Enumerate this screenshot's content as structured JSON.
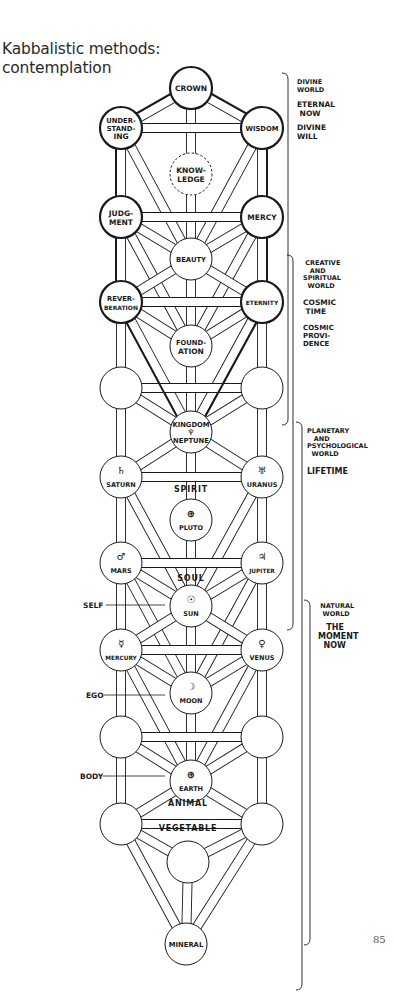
{
  "page": {
    "title_line1": "Kabbalistic methods:",
    "title_line2": "contemplation",
    "page_number": "85"
  },
  "colors": {
    "ink": "#1a1a1a",
    "paper": "#ffffff"
  },
  "nodes": [
    {
      "id": "crown",
      "x": 191,
      "y": 88,
      "lines": [
        "CROWN"
      ],
      "heavy": true
    },
    {
      "id": "understanding",
      "x": 121,
      "y": 128,
      "lines": [
        "UNDER-",
        "STAND-",
        "ING"
      ],
      "heavy": true
    },
    {
      "id": "wisdom",
      "x": 262,
      "y": 128,
      "lines": [
        "WISDOM"
      ],
      "heavy": true
    },
    {
      "id": "knowledge",
      "x": 191,
      "y": 174,
      "lines": [
        "KNOW-",
        "LEDGE"
      ],
      "dashed": true
    },
    {
      "id": "judgment",
      "x": 121,
      "y": 217,
      "lines": [
        "JUDG-",
        "MENT"
      ],
      "heavy": true
    },
    {
      "id": "mercy",
      "x": 262,
      "y": 217,
      "lines": [
        "MERCY"
      ],
      "heavy": true
    },
    {
      "id": "beauty",
      "x": 191,
      "y": 259,
      "lines": [
        "BEAUTY"
      ]
    },
    {
      "id": "reverberation",
      "x": 121,
      "y": 302,
      "lines": [
        "REVER-",
        "BERATION"
      ],
      "heavy": true
    },
    {
      "id": "eternity",
      "x": 262,
      "y": 302,
      "lines": [
        "ETERNITY"
      ],
      "heavy": true
    },
    {
      "id": "foundation",
      "x": 191,
      "y": 346,
      "lines": [
        "FOUND-",
        "ATION"
      ]
    },
    {
      "id": "empty-left-1",
      "x": 121,
      "y": 388,
      "lines": []
    },
    {
      "id": "empty-right-1",
      "x": 262,
      "y": 388,
      "lines": []
    },
    {
      "id": "kingdom",
      "x": 191,
      "y": 432,
      "lines": [
        "KINGDOM",
        "♆",
        "NEPTUNE"
      ]
    },
    {
      "id": "saturn",
      "x": 121,
      "y": 477,
      "symbol": "♄",
      "lines": [
        "SATURN"
      ]
    },
    {
      "id": "uranus",
      "x": 262,
      "y": 477,
      "symbol": "♅",
      "lines": [
        "URANUS"
      ]
    },
    {
      "id": "pluto",
      "x": 191,
      "y": 520,
      "symbol": "⊕",
      "lines": [
        "PLUTO"
      ]
    },
    {
      "id": "mars",
      "x": 121,
      "y": 563,
      "symbol": "♂",
      "lines": [
        "MARS"
      ]
    },
    {
      "id": "jupiter",
      "x": 262,
      "y": 563,
      "symbol": "♃",
      "lines": [
        "JUPITER"
      ]
    },
    {
      "id": "sun",
      "x": 191,
      "y": 606,
      "symbol": "☉",
      "lines": [
        "SUN"
      ]
    },
    {
      "id": "mercury",
      "x": 121,
      "y": 650,
      "symbol": "☿",
      "lines": [
        "MERCURY"
      ]
    },
    {
      "id": "venus",
      "x": 262,
      "y": 650,
      "symbol": "♀",
      "lines": [
        "VENUS"
      ]
    },
    {
      "id": "moon",
      "x": 191,
      "y": 693,
      "symbol": "☽",
      "lines": [
        "MOON"
      ]
    },
    {
      "id": "empty-left-2",
      "x": 121,
      "y": 737,
      "lines": []
    },
    {
      "id": "empty-right-2",
      "x": 262,
      "y": 737,
      "lines": []
    },
    {
      "id": "earth",
      "x": 191,
      "y": 781,
      "symbol": "⊕",
      "lines": [
        "EARTH"
      ]
    },
    {
      "id": "empty-left-3",
      "x": 121,
      "y": 824,
      "lines": []
    },
    {
      "id": "empty-right-3",
      "x": 262,
      "y": 824,
      "lines": []
    },
    {
      "id": "vegetable-node",
      "x": 188,
      "y": 862,
      "lines": []
    },
    {
      "id": "mineral",
      "x": 186,
      "y": 944,
      "lines": [
        "MINERAL"
      ]
    }
  ],
  "paths": [
    [
      "crown",
      "understanding"
    ],
    [
      "crown",
      "wisdom"
    ],
    [
      "crown",
      "knowledge"
    ],
    [
      "understanding",
      "wisdom"
    ],
    [
      "understanding",
      "judgment"
    ],
    [
      "understanding",
      "beauty"
    ],
    [
      "wisdom",
      "mercy"
    ],
    [
      "wisdom",
      "beauty"
    ],
    [
      "knowledge",
      "beauty"
    ],
    [
      "judgment",
      "mercy"
    ],
    [
      "judgment",
      "beauty"
    ],
    [
      "judgment",
      "reverberation"
    ],
    [
      "judgment",
      "foundation"
    ],
    [
      "mercy",
      "beauty"
    ],
    [
      "mercy",
      "eternity"
    ],
    [
      "mercy",
      "foundation"
    ],
    [
      "beauty",
      "reverberation"
    ],
    [
      "beauty",
      "eternity"
    ],
    [
      "beauty",
      "foundation"
    ],
    [
      "reverberation",
      "eternity"
    ],
    [
      "reverberation",
      "foundation"
    ],
    [
      "reverberation",
      "empty-left-1"
    ],
    [
      "reverberation",
      "kingdom"
    ],
    [
      "eternity",
      "foundation"
    ],
    [
      "eternity",
      "empty-right-1"
    ],
    [
      "eternity",
      "kingdom"
    ],
    [
      "foundation",
      "kingdom"
    ],
    [
      "empty-left-1",
      "empty-right-1"
    ],
    [
      "empty-left-1",
      "kingdom"
    ],
    [
      "empty-left-1",
      "saturn"
    ],
    [
      "empty-right-1",
      "kingdom"
    ],
    [
      "empty-right-1",
      "uranus"
    ],
    [
      "kingdom",
      "saturn"
    ],
    [
      "kingdom",
      "uranus"
    ],
    [
      "kingdom",
      "pluto"
    ],
    [
      "saturn",
      "uranus"
    ],
    [
      "saturn",
      "mars"
    ],
    [
      "saturn",
      "sun"
    ],
    [
      "uranus",
      "jupiter"
    ],
    [
      "uranus",
      "sun"
    ],
    [
      "pluto",
      "sun"
    ],
    [
      "mars",
      "jupiter"
    ],
    [
      "mars",
      "sun"
    ],
    [
      "mars",
      "mercury"
    ],
    [
      "mars",
      "moon"
    ],
    [
      "jupiter",
      "sun"
    ],
    [
      "jupiter",
      "venus"
    ],
    [
      "jupiter",
      "moon"
    ],
    [
      "sun",
      "mercury"
    ],
    [
      "sun",
      "venus"
    ],
    [
      "sun",
      "moon"
    ],
    [
      "mercury",
      "venus"
    ],
    [
      "mercury",
      "moon"
    ],
    [
      "mercury",
      "empty-left-2"
    ],
    [
      "mercury",
      "earth"
    ],
    [
      "venus",
      "moon"
    ],
    [
      "venus",
      "empty-right-2"
    ],
    [
      "venus",
      "earth"
    ],
    [
      "moon",
      "earth"
    ],
    [
      "empty-left-2",
      "empty-right-2"
    ],
    [
      "empty-left-2",
      "earth"
    ],
    [
      "empty-left-2",
      "empty-left-3"
    ],
    [
      "empty-right-2",
      "earth"
    ],
    [
      "empty-right-2",
      "empty-right-3"
    ],
    [
      "earth",
      "empty-left-3"
    ],
    [
      "earth",
      "empty-right-3"
    ],
    [
      "empty-left-3",
      "empty-right-3"
    ],
    [
      "empty-left-3",
      "vegetable-node"
    ],
    [
      "empty-left-3",
      "mineral"
    ],
    [
      "empty-right-3",
      "vegetable-node"
    ],
    [
      "empty-right-3",
      "mineral"
    ],
    [
      "vegetable-node",
      "mineral"
    ]
  ],
  "heavy_outline": [
    [
      "crown",
      "understanding"
    ],
    [
      "crown",
      "wisdom"
    ],
    [
      "understanding",
      "judgment"
    ],
    [
      "wisdom",
      "mercy"
    ],
    [
      "judgment",
      "reverberation"
    ],
    [
      "mercy",
      "eternity"
    ],
    [
      "reverberation",
      "kingdom"
    ],
    [
      "eternity",
      "kingdom"
    ]
  ],
  "between_labels": [
    {
      "text": "SPIRIT",
      "x": 191,
      "y": 492
    },
    {
      "text": "SOUL",
      "x": 191,
      "y": 581
    },
    {
      "text": "ANIMAL",
      "x": 188,
      "y": 806
    },
    {
      "text": "VEGETABLE",
      "x": 188,
      "y": 831
    }
  ],
  "side_labels": [
    {
      "text": "SELF",
      "x": 83,
      "y": 605,
      "line_to": 165
    },
    {
      "text": "EGO",
      "x": 86,
      "y": 695,
      "line_to": 165
    },
    {
      "text": "BODY",
      "x": 80,
      "y": 776,
      "line_to": 165
    }
  ],
  "worlds": [
    {
      "name": "divine-world",
      "bracket": {
        "x": 288,
        "top": 73,
        "bottom": 425
      },
      "text_x": 297,
      "blocks": [
        {
          "y": 84,
          "lines": [
            "DIVINE",
            "WORLD"
          ],
          "size": 6.5
        },
        {
          "y": 107,
          "lines": [
            "ETERNAL",
            " NOW"
          ],
          "size": 7.5
        },
        {
          "y": 130,
          "lines": [
            "DIVINE",
            "WILL"
          ],
          "size": 7.5
        }
      ]
    },
    {
      "name": "creative-spiritual-world",
      "bracket": {
        "x": 293,
        "top": 255,
        "bottom": 630
      },
      "text_x": 303,
      "blocks": [
        {
          "y": 265,
          "lines": [
            " CREATIVE",
            "   AND",
            "SPIRITUAL",
            "  WORLD"
          ],
          "size": 6.5
        },
        {
          "y": 305,
          "lines": [
            "COSMIC",
            " TIME"
          ],
          "size": 7.5
        },
        {
          "y": 330,
          "lines": [
            "COSMIC",
            "PROVI-",
            "DENCE"
          ],
          "size": 7
        }
      ]
    },
    {
      "name": "planetary-psychological-world",
      "bracket": {
        "x": 302,
        "top": 422,
        "bottom": 990
      },
      "text_x": 307,
      "blocks": [
        {
          "y": 433,
          "lines": [
            "PLANETARY",
            "   AND",
            "PSYCHOLOGICAL",
            "  WORLD"
          ],
          "size": 6.5
        },
        {
          "y": 474,
          "lines": [
            "LIFETIME"
          ],
          "size": 8
        }
      ]
    },
    {
      "name": "natural-world",
      "bracket": {
        "x": 310,
        "top": 600,
        "bottom": 945
      },
      "text_x": 318,
      "blocks": [
        {
          "y": 608,
          "lines": [
            " NATURAL",
            "  WORLD"
          ],
          "size": 6.5
        },
        {
          "y": 630,
          "lines": [
            "   THE",
            "MOMENT",
            "  NOW"
          ],
          "size": 8
        }
      ]
    }
  ]
}
